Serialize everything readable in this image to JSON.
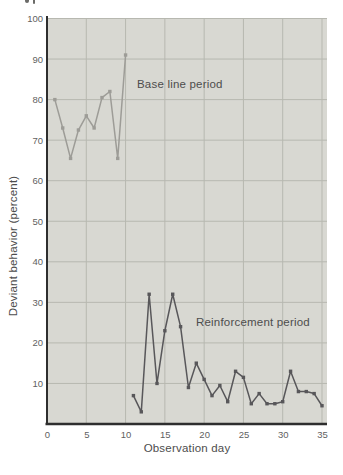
{
  "chart_data": {
    "type": "line",
    "title": "",
    "xlabel": "Observation day",
    "ylabel": "Deviant behavior (percent)",
    "xlim": [
      0,
      35.7
    ],
    "ylim": [
      0,
      100
    ],
    "x_ticks": [
      0,
      5,
      10,
      15,
      20,
      25,
      30,
      35
    ],
    "y_ticks": [
      10,
      20,
      30,
      40,
      50,
      60,
      70,
      80,
      90,
      100
    ],
    "grid": true,
    "legend": "none",
    "annotations": [
      {
        "text": "Base line period",
        "x": 11.5,
        "y": 83
      },
      {
        "text": "Reinforcement period",
        "x": 19,
        "y": 25.5
      }
    ],
    "series": [
      {
        "name": "Base line period",
        "color": "#9d9c97",
        "x": [
          1,
          2,
          3,
          4,
          5,
          6,
          7,
          8,
          9,
          10
        ],
        "y": [
          80,
          73,
          65.5,
          72.5,
          76,
          73,
          80.5,
          82,
          65.5,
          91
        ]
      },
      {
        "name": "Reinforcement period",
        "color": "#58575a",
        "x": [
          11,
          12,
          13,
          14,
          15,
          16,
          17,
          18,
          19,
          20,
          21,
          22,
          23,
          24,
          25,
          26,
          27,
          28,
          29,
          30,
          31,
          32,
          33,
          34,
          35
        ],
        "y": [
          7,
          3,
          32,
          10,
          23,
          32,
          24,
          9,
          15,
          11,
          7,
          9.5,
          5.5,
          13,
          11.5,
          5,
          7.5,
          5,
          5,
          5.5,
          13,
          8,
          8,
          7.5,
          4.5
        ]
      }
    ],
    "colors": {
      "plot_background": "#d8d8d2",
      "gridline": "#b7b8b0",
      "axis": "#2e2e2e",
      "tick_label": "#5f5f5f",
      "annotation_text": "#4d4d4d"
    }
  }
}
